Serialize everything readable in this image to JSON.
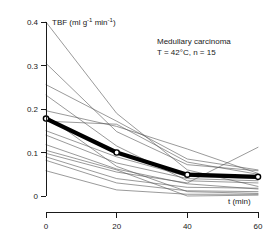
{
  "figure": {
    "name": "tbf-vs-time-medullary-carcinoma"
  },
  "annotation": {
    "line1": "Medullary carcinoma",
    "line2": "T = 42°C, n = 15"
  },
  "axes": {
    "y_title_prefix": "TBF (ml g",
    "y_title_sup1": "-1",
    "y_title_mid": " min",
    "y_title_sup2": "-1",
    "y_title_suffix": ")",
    "x_title": "t (min)",
    "y_ticks": [
      "0",
      "0.1",
      "0.2",
      "0.3",
      "0.4"
    ],
    "x_ticks": [
      "0",
      "20",
      "40",
      "60"
    ]
  },
  "chart_data": {
    "type": "line",
    "title": "Medullary carcinoma",
    "subtitle": "T = 42°C, n = 15",
    "xlabel": "t (min)",
    "ylabel": "TBF (ml g-1 min-1)",
    "xlim": [
      0,
      60
    ],
    "ylim": [
      0,
      0.4
    ],
    "x_ticks": [
      0,
      20,
      40,
      60
    ],
    "y_ticks": [
      0,
      0.1,
      0.2,
      0.3,
      0.4
    ],
    "grid": false,
    "legend": "none",
    "x": [
      0,
      20,
      40,
      60
    ],
    "series": [
      {
        "name": "mean",
        "emphasis": "thick-with-open-circles",
        "values": [
          0.178,
          0.1,
          0.049,
          0.044
        ]
      },
      {
        "name": "subject-01",
        "values": [
          0.4,
          0.19,
          0.06,
          0.022
        ]
      },
      {
        "name": "subject-02",
        "values": [
          0.305,
          0.148,
          0.072,
          0.058
        ]
      },
      {
        "name": "subject-03",
        "values": [
          0.256,
          0.172,
          0.085,
          0.06
        ]
      },
      {
        "name": "subject-04",
        "values": [
          0.232,
          0.115,
          0.035,
          0.03
        ]
      },
      {
        "name": "subject-05",
        "values": [
          0.196,
          0.16,
          0.108,
          0.052
        ]
      },
      {
        "name": "subject-06",
        "values": [
          0.185,
          0.068,
          0.01,
          0.006
        ]
      },
      {
        "name": "subject-07",
        "values": [
          0.172,
          0.165,
          0.078,
          0.05
        ]
      },
      {
        "name": "subject-08",
        "values": [
          0.15,
          0.09,
          0.045,
          0.04
        ]
      },
      {
        "name": "subject-09",
        "values": [
          0.14,
          0.076,
          0.04,
          0.035
        ]
      },
      {
        "name": "subject-10",
        "values": [
          0.118,
          0.062,
          0.028,
          0.016
        ]
      },
      {
        "name": "subject-11",
        "values": [
          0.105,
          0.06,
          0.0,
          0.002
        ]
      },
      {
        "name": "subject-12",
        "values": [
          0.098,
          0.055,
          0.03,
          0.112
        ]
      },
      {
        "name": "subject-13",
        "values": [
          0.09,
          0.04,
          0.02,
          0.018
        ]
      },
      {
        "name": "subject-14",
        "values": [
          0.082,
          0.03,
          0.012,
          0.01
        ]
      },
      {
        "name": "subject-15",
        "values": [
          0.058,
          0.014,
          0.004,
          0.004
        ]
      }
    ]
  }
}
